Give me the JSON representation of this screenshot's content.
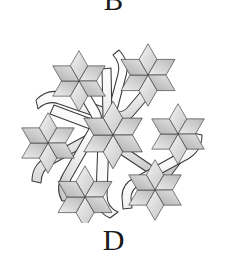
{
  "figure": {
    "background_color": "#ffffff",
    "label_top": "B",
    "label_bottom": "D",
    "stroke_color": "#2b2b2b",
    "band_fill_light": "#fbfbfb",
    "band_fill_shade": "#d6d6d6",
    "star_fill_light": "#efefef",
    "star_fill_mid": "#d0d0d0",
    "star_fill_dark": "#b4b4b4",
    "star_count_outer": 6,
    "star_count_center": 1,
    "band_count": 3,
    "stars": [
      {
        "name": "star-top-left",
        "cx": 62,
        "cy": 48,
        "r": 30
      },
      {
        "name": "star-top-right",
        "cx": 131,
        "cy": 42,
        "r": 31
      },
      {
        "name": "star-left",
        "cx": 31,
        "cy": 110,
        "r": 30
      },
      {
        "name": "star-center",
        "cx": 96,
        "cy": 102,
        "r": 34
      },
      {
        "name": "star-right",
        "cx": 161,
        "cy": 101,
        "r": 30
      },
      {
        "name": "star-bottom-left",
        "cx": 68,
        "cy": 164,
        "r": 31
      },
      {
        "name": "star-bottom-right",
        "cx": 138,
        "cy": 157,
        "r": 30
      }
    ]
  }
}
